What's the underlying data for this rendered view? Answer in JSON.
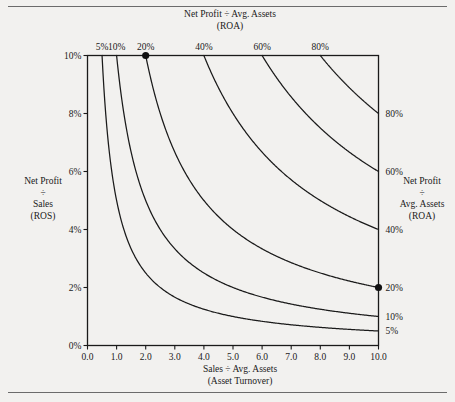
{
  "figure": {
    "axis_titles": {
      "top": [
        "Net Profit ÷ Avg. Assets",
        "(ROA)"
      ],
      "bottom": [
        "Sales ÷ Avg. Assets",
        "(Asset Turnover)"
      ],
      "left": [
        "Net Profit",
        "÷",
        "Sales",
        "(ROS)"
      ],
      "right": [
        "Net Profit",
        "÷",
        "Avg. Assets",
        "(ROA)"
      ]
    }
  },
  "chart_data": {
    "type": "line",
    "title": "Net Profit ÷ Avg. Assets (ROA)",
    "subtitle": "(ROA)",
    "xlabel": "Sales ÷ Avg. Assets (Asset Turnover)",
    "ylabel": "Net Profit ÷ Sales (ROS)",
    "xlim": [
      0.0,
      10.0
    ],
    "ylim": [
      0.0,
      0.1
    ],
    "grid": false,
    "legend": "none",
    "relationship": "ROA = ROS x Asset Turnover  (iso-ROA hyperbolas)",
    "xticks": [
      0.0,
      1.0,
      2.0,
      3.0,
      4.0,
      5.0,
      6.0,
      7.0,
      8.0,
      9.0,
      10.0
    ],
    "xticklabels": [
      "0.0",
      "1.0",
      "2.0",
      "3.0",
      "4.0",
      "5.0",
      "6.0",
      "7.0",
      "8.0",
      "9.0",
      "10.0"
    ],
    "yticks": [
      0.0,
      0.02,
      0.04,
      0.06,
      0.08,
      0.1
    ],
    "yticklabels": [
      "0%",
      "2%",
      "4%",
      "6%",
      "8%",
      "10%"
    ],
    "top_axis_ticks": [
      {
        "label": "5%",
        "roa": 0.05,
        "x_at_top": 0.5
      },
      {
        "label": "10%",
        "roa": 0.1,
        "x_at_top": 1.0
      },
      {
        "label": "20%",
        "roa": 0.2,
        "x_at_top": 2.0
      },
      {
        "label": "40%",
        "roa": 0.4,
        "x_at_top": 4.0
      },
      {
        "label": "60%",
        "roa": 0.6,
        "x_at_top": 6.0
      },
      {
        "label": "80%",
        "roa": 0.8,
        "x_at_top": 8.0
      }
    ],
    "right_axis_ticks": [
      {
        "label": "80%",
        "roa": 0.8,
        "ros_at_x10": 0.08
      },
      {
        "label": "60%",
        "roa": 0.6,
        "ros_at_x10": 0.06
      },
      {
        "label": "40%",
        "roa": 0.4,
        "ros_at_x10": 0.04
      },
      {
        "label": "20%",
        "roa": 0.2,
        "ros_at_x10": 0.02
      },
      {
        "label": "10%",
        "roa": 0.1,
        "ros_at_x10": 0.01
      },
      {
        "label": "5%",
        "roa": 0.05,
        "ros_at_x10": 0.005
      }
    ],
    "series": [
      {
        "name": "5% ROA",
        "roa": 0.05,
        "label": "5%",
        "color": "#1a1a1a"
      },
      {
        "name": "10% ROA",
        "roa": 0.1,
        "label": "10%",
        "color": "#1a1a1a"
      },
      {
        "name": "20% ROA",
        "roa": 0.2,
        "label": "20%",
        "color": "#1a1a1a"
      },
      {
        "name": "40% ROA",
        "roa": 0.4,
        "label": "40%",
        "color": "#1a1a1a"
      },
      {
        "name": "60% ROA",
        "roa": 0.6,
        "label": "60%",
        "color": "#1a1a1a"
      },
      {
        "name": "80% ROA",
        "roa": 0.8,
        "label": "80%",
        "color": "#1a1a1a"
      }
    ],
    "markers": [
      {
        "name": "marker-top",
        "x": 2.0,
        "y": 0.1,
        "roa": 0.2
      },
      {
        "name": "marker-right",
        "x": 10.0,
        "y": 0.02,
        "roa": 0.2
      }
    ]
  }
}
